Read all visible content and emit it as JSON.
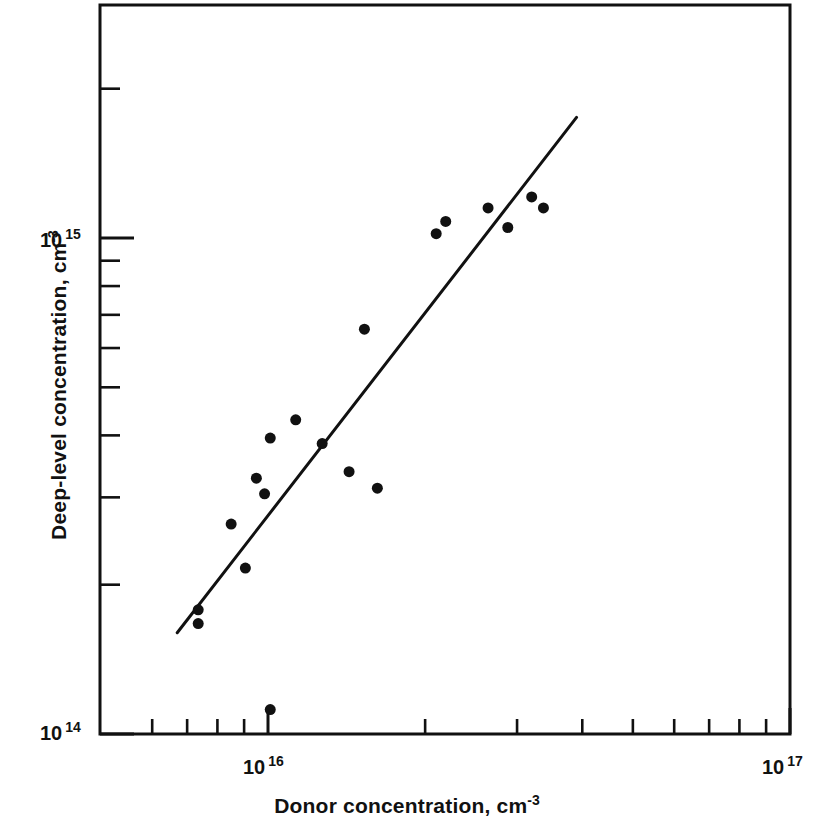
{
  "chart_data": {
    "type": "scatter",
    "title": "",
    "xlabel": "Donor concentration, cm -3",
    "ylabel": "Deep-level concentration, cm -3",
    "xscale": "log",
    "yscale": "log",
    "xlim": [
      6000000000000000.0,
      1e+17
    ],
    "ylim": [
      100000000000000.0,
      2600000000000000.0
    ],
    "grid": false,
    "legend": null,
    "x_major_ticks": [
      {
        "value": 1e+16,
        "label": "10",
        "exponent": "16"
      },
      {
        "value": 1e+17,
        "label": "10",
        "exponent": "17"
      }
    ],
    "y_major_ticks": [
      {
        "value": 100000000000000.0,
        "label": "10",
        "exponent": "14"
      },
      {
        "value": 1000000000000000.0,
        "label": "10",
        "exponent": "15"
      }
    ],
    "x_minor_ticks": [
      6000000000000000.0,
      7000000000000000.0,
      8000000000000000.0,
      9000000000000000.0,
      2e+16,
      3e+16,
      4e+16,
      5e+16,
      6e+16,
      7e+16,
      8e+16,
      9e+16
    ],
    "y_minor_ticks": [
      200000000000000.0,
      300000000000000.0,
      400000000000000.0,
      500000000000000.0,
      600000000000000.0,
      700000000000000.0,
      800000000000000.0,
      900000000000000.0,
      2000000000000000.0
    ],
    "series": [
      {
        "name": "measured samples",
        "marker": "filled-circle",
        "marker_color": "#111111",
        "marker_size": 11,
        "points": [
          {
            "x": 7350000000000000.0,
            "y": 178000000000000.0
          },
          {
            "x": 7350000000000000.0,
            "y": 167000000000000.0
          },
          {
            "x": 9050000000000000.0,
            "y": 216000000000000.0
          },
          {
            "x": 1.01e+16,
            "y": 112000000000000.0
          },
          {
            "x": 8500000000000000.0,
            "y": 265000000000000.0
          },
          {
            "x": 9850000000000000.0,
            "y": 305000000000000.0
          },
          {
            "x": 9500000000000000.0,
            "y": 328000000000000.0
          },
          {
            "x": 1.01e+16,
            "y": 395000000000000.0
          },
          {
            "x": 1.13e+16,
            "y": 430000000000000.0
          },
          {
            "x": 1.27e+16,
            "y": 385000000000000.0
          },
          {
            "x": 1.43e+16,
            "y": 338000000000000.0
          },
          {
            "x": 1.62e+16,
            "y": 313000000000000.0
          },
          {
            "x": 1.53e+16,
            "y": 655000000000000.0
          },
          {
            "x": 2.1e+16,
            "y": 1020000000000000.0
          },
          {
            "x": 2.19e+16,
            "y": 1080000000000000.0
          },
          {
            "x": 2.64e+16,
            "y": 1150000000000000.0
          },
          {
            "x": 2.88e+16,
            "y": 1050000000000000.0
          },
          {
            "x": 3.2e+16,
            "y": 1210000000000000.0
          },
          {
            "x": 3.37e+16,
            "y": 1150000000000000.0
          }
        ]
      }
    ],
    "fit_line": {
      "name": "linear fit (log-log)",
      "color": "#111111",
      "width": 3,
      "x_start": 6700000000000000.0,
      "y_start": 160000000000000.0,
      "x_end": 3.9e+16,
      "y_end": 1750000000000000.0
    }
  },
  "axes": {
    "x_title_main": "Donor  concentration,  cm",
    "x_title_exp": "-3",
    "y_title_main": "Deep-level concentration,  cm",
    "y_title_exp": "-3",
    "y_label_1e15_base": "10",
    "y_label_1e15_exp": "15",
    "y_label_1e14_base": "10",
    "y_label_1e14_exp": "14",
    "x_label_1e16_base": "10",
    "x_label_1e16_exp": "16",
    "x_label_1e17_base": "10",
    "x_label_1e17_exp": "17"
  },
  "style": {
    "background": "#ffffff",
    "ink": "#111111",
    "frame_width": 3
  }
}
